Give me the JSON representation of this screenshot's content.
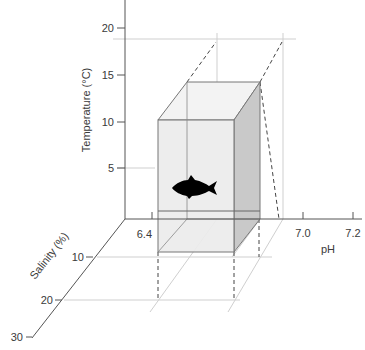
{
  "axes": {
    "temperature": {
      "title": "Temperature (°C)",
      "ticks": [
        "20",
        "15",
        "10",
        "5"
      ]
    },
    "ph": {
      "title": "pH",
      "ticks": [
        "6.4",
        "7.0",
        "7.2"
      ]
    },
    "salinity": {
      "title": "Salinity (%)",
      "ticks": [
        "10",
        "20",
        "30"
      ]
    }
  },
  "niche_box": {
    "temperature_range": [
      "5",
      "10"
    ],
    "ph_range": [
      "6.4",
      "7.0"
    ],
    "salinity_range": [
      "10",
      "20"
    ],
    "icon": "fish-icon"
  },
  "colors": {
    "axis": "#555555",
    "grid": "#cfcfcf",
    "box_front": "#ececec",
    "box_side": "#c9c9c9",
    "box_top": "#f3f3f3",
    "fish": "#000000"
  }
}
